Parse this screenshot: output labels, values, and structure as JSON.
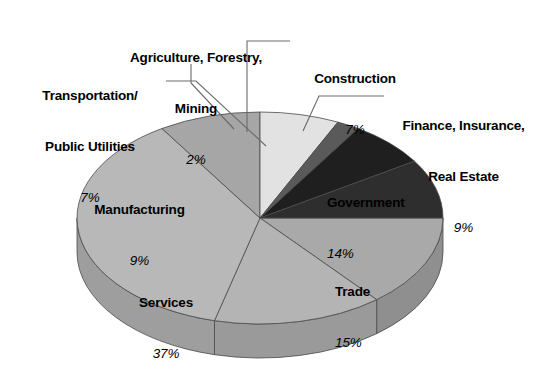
{
  "chart_data": {
    "type": "pie",
    "title": "",
    "subtitle": "",
    "xlabel": "",
    "ylabel": "",
    "legend_position": "none",
    "grid": false,
    "value_unit": "%",
    "total": 100,
    "categories": [
      "Government",
      "Trade",
      "Services",
      "Manufacturing",
      "Transportation/\nPublic Utilities",
      "Agriculture, Forestry,\nMining",
      "Construction",
      "Finance, Insurance,\nReal Estate"
    ],
    "values": [
      14,
      15,
      37,
      9,
      7,
      2,
      7,
      9
    ],
    "slices": [
      {
        "name": "Government",
        "label_line1": "Government",
        "label_line2": "",
        "value": 14,
        "pct_text": "14%",
        "color": "#a9a9a9",
        "side_color": "#8f8f8f",
        "start_deg": 0,
        "end_deg": 50.4,
        "label_x": 327,
        "label_y": 159,
        "label_align": "left",
        "has_leader": false
      },
      {
        "name": "Trade",
        "label_line1": "Trade",
        "label_line2": "",
        "value": 15,
        "pct_text": "15%",
        "color": "#b4b4b4",
        "side_color": "#9a9a9a",
        "start_deg": 50.4,
        "end_deg": 104.4,
        "label_x": 334,
        "label_y": 248,
        "label_align": "left",
        "has_leader": false
      },
      {
        "name": "Services",
        "label_line1": "Services",
        "label_line2": "",
        "value": 37,
        "pct_text": "37%",
        "color": "#b8b8b8",
        "side_color": "#9e9e9e",
        "start_deg": 104.4,
        "end_deg": 237.6,
        "label_x": 160,
        "label_y": 259,
        "label_align": "center",
        "has_leader": false
      },
      {
        "name": "Manufacturing",
        "label_line1": "Manufacturing",
        "label_line2": "",
        "value": 9,
        "pct_text": "9%",
        "color": "#a6a6a6",
        "side_color": "#8c8c8c",
        "start_deg": 237.6,
        "end_deg": 270,
        "label_x": 138,
        "label_y": 166,
        "label_align": "center",
        "has_leader": false
      },
      {
        "name": "Transportation/Public Utilities",
        "label_line1": "Transportation/",
        "label_line2": "Public Utilities",
        "value": 7,
        "pct_text": "7%",
        "color": "#e2e2e2",
        "side_color": "#c6c6c6",
        "start_deg": 270,
        "end_deg": 295.2,
        "label_x": 104,
        "label_y": 52,
        "label_align": "center",
        "has_leader": true
      },
      {
        "name": "Agriculture, Forestry, Mining",
        "label_line1": "Agriculture, Forestry,",
        "label_line2": "Mining",
        "value": 2,
        "pct_text": "2%",
        "color": "#5a5a5a",
        "side_color": "#454545",
        "start_deg": 295.2,
        "end_deg": 302.4,
        "label_x": 195,
        "label_y": 14,
        "label_align": "center",
        "has_leader": true
      },
      {
        "name": "Construction",
        "label_line1": "Construction",
        "label_line2": "",
        "value": 7,
        "pct_text": "7%",
        "color": "#1f1f1f",
        "side_color": "#141414",
        "start_deg": 302.4,
        "end_deg": 327.6,
        "label_x": 355,
        "label_y": 35,
        "label_align": "center",
        "has_leader": true
      },
      {
        "name": "Finance, Insurance, Real Estate",
        "label_line1": "Finance, Insurance,",
        "label_line2": "Real Estate",
        "value": 9,
        "pct_text": "9%",
        "color": "#2e2e2e",
        "side_color": "#1e1e1e",
        "start_deg": 327.6,
        "end_deg": 360,
        "label_x": 474,
        "label_y": 82,
        "label_align": "center",
        "has_leader": true
      }
    ],
    "geometry": {
      "center_x": 260,
      "center_y": 218,
      "radius_x": 183,
      "radius_y": 106,
      "depth": 34
    },
    "colors": {
      "background": "#ffffff",
      "outline": "#4a4a4a",
      "leader_line": "#6a6a6a",
      "text": "#000000"
    }
  }
}
